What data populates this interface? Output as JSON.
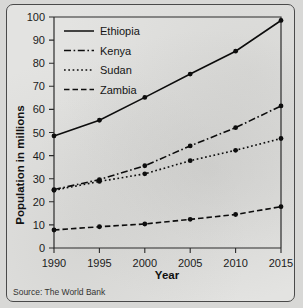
{
  "chart_data": {
    "type": "line",
    "title": "",
    "xlabel": "Year",
    "ylabel": "Population in millions",
    "x": [
      1990,
      1995,
      2000,
      2005,
      2010,
      2015
    ],
    "categories": [
      "1990",
      "1995",
      "2000",
      "2005",
      "2010",
      "2015"
    ],
    "xlim": [
      1990,
      2015
    ],
    "ylim": [
      0,
      100
    ],
    "ytick_labels": [
      "0",
      "10",
      "20",
      "30",
      "40",
      "50",
      "60",
      "70",
      "80",
      "90",
      "100"
    ],
    "yticks": [
      0,
      10,
      20,
      30,
      40,
      50,
      60,
      70,
      80,
      90,
      100
    ],
    "grid": false,
    "legend_position": "top-left",
    "series": [
      {
        "name": "Ethiopia",
        "style": "solid",
        "values": [
          48.5,
          55.3,
          65.2,
          75.3,
          85.2,
          98.5
        ]
      },
      {
        "name": "Kenya",
        "style": "dash-dot",
        "values": [
          25.3,
          29.6,
          35.6,
          44.2,
          52.1,
          61.5
        ]
      },
      {
        "name": "Sudan",
        "style": "dotted",
        "values": [
          25.0,
          28.8,
          32.1,
          37.8,
          42.3,
          47.4
        ]
      },
      {
        "name": "Zambia",
        "style": "dashed",
        "values": [
          7.8,
          9.2,
          10.4,
          12.4,
          14.5,
          17.9
        ]
      }
    ],
    "annotations": [
      "Source: The World Bank"
    ]
  },
  "caption": {
    "source": "Source: The World Bank"
  },
  "axes": {
    "x_title": "Year",
    "y_title": "Population in millions"
  }
}
